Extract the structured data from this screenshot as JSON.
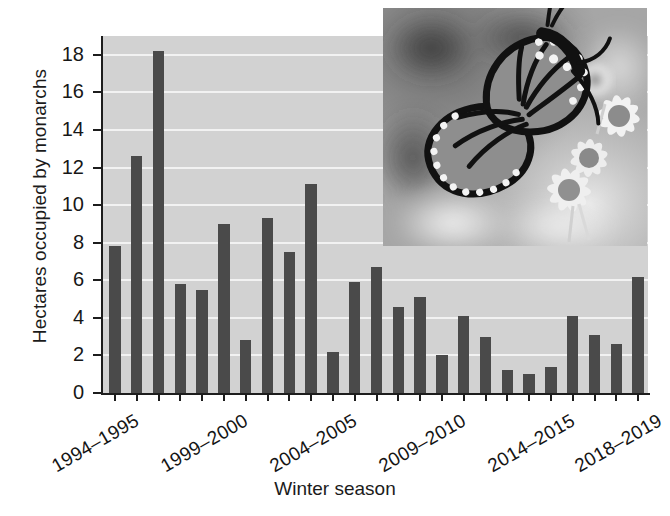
{
  "chart_data": {
    "type": "bar",
    "title": "",
    "xlabel": "Winter season",
    "ylabel": "Hectares occupied by monarchs",
    "ylim": [
      0,
      19
    ],
    "yticks": [
      0,
      2,
      4,
      6,
      8,
      10,
      12,
      14,
      16,
      18
    ],
    "grid": true,
    "legend": "none",
    "categories": [
      "1994-1995",
      "1995-1996",
      "1996-1997",
      "1997-1998",
      "1998-1999",
      "1999-2000",
      "2000-2001",
      "2001-2002",
      "2002-2003",
      "2003-2004",
      "2004-2005",
      "2005-2006",
      "2006-2007",
      "2007-2008",
      "2008-2009",
      "2009-2010",
      "2010-2011",
      "2011-2012",
      "2012-2013",
      "2013-2014",
      "2014-2015",
      "2015-2016",
      "2016-2017",
      "2017-2018",
      "2018-2019"
    ],
    "values": [
      7.8,
      12.6,
      18.2,
      5.8,
      5.5,
      9.0,
      2.8,
      9.3,
      7.5,
      11.1,
      2.2,
      5.9,
      6.7,
      4.6,
      5.1,
      2.0,
      4.1,
      3.0,
      1.2,
      1.0,
      1.4,
      4.1,
      3.1,
      2.6,
      6.2
    ],
    "tick_labels": [
      {
        "index": 0,
        "text": "1994–1995"
      },
      {
        "index": 5,
        "text": "1999–2000"
      },
      {
        "index": 10,
        "text": "2004–2005"
      },
      {
        "index": 15,
        "text": "2009–2010"
      },
      {
        "index": 20,
        "text": "2014–2015"
      },
      {
        "index": 24,
        "text": "2018–2019"
      }
    ],
    "bar_color": "#4a4a4a",
    "plot_background": "#d2d2d2",
    "gridline_color": "#f2f2f2"
  },
  "inset": {
    "name": "monarch-butterfly-photo",
    "description": "Monarch butterfly feeding on daisy flowers",
    "style": "grayscale photograph"
  },
  "axes": {
    "y_title": "Hectares occupied by monarchs",
    "x_title": "Winter season"
  }
}
